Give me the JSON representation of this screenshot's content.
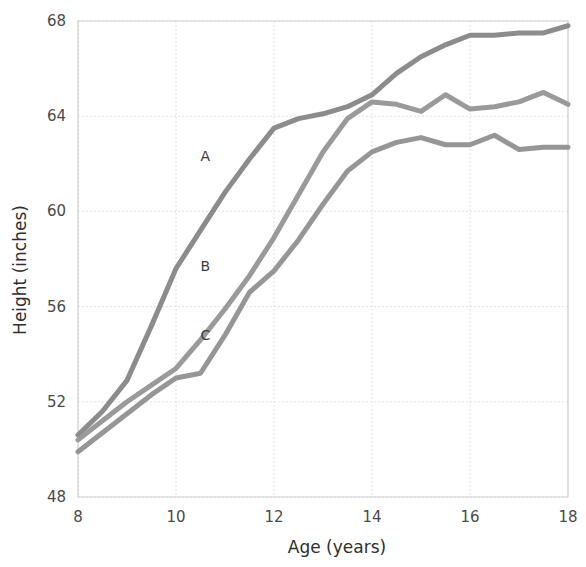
{
  "chart_data": {
    "type": "line",
    "title": "",
    "xlabel": "Age (years)",
    "ylabel": "Height (inches)",
    "xlim": [
      8,
      18
    ],
    "ylim": [
      48,
      68
    ],
    "xticks": [
      8,
      10,
      12,
      14,
      16,
      18
    ],
    "yticks": [
      48,
      52,
      56,
      60,
      64,
      68
    ],
    "xtick_labels": [
      "8",
      "10",
      "12",
      "14",
      "16",
      "18"
    ],
    "ytick_labels": [
      "48",
      "52",
      "56",
      "60",
      "64",
      "68"
    ],
    "grid": true,
    "legend_position": "inline-annotations",
    "x": [
      8,
      8.5,
      9,
      9.5,
      10,
      10.5,
      11,
      11.5,
      12,
      12.5,
      13,
      13.5,
      14,
      14.5,
      15,
      15.5,
      16,
      16.5,
      17,
      17.5,
      18
    ],
    "series": [
      {
        "name": "A",
        "label": "A",
        "color": "#8c8c8c",
        "values": [
          50.6,
          51.6,
          52.9,
          55.2,
          57.6,
          59.2,
          60.8,
          62.2,
          63.5,
          63.9,
          64.1,
          64.4,
          64.9,
          65.8,
          66.5,
          67.0,
          67.4,
          67.4,
          67.5,
          67.5,
          67.8
        ],
        "annotation": {
          "text": "A",
          "x": 10.6,
          "y": 62.1
        }
      },
      {
        "name": "B",
        "label": "B",
        "color": "#9a9a9a",
        "values": [
          50.4,
          51.2,
          52.0,
          52.7,
          53.4,
          54.6,
          55.9,
          57.3,
          58.9,
          60.7,
          62.5,
          63.9,
          64.6,
          64.5,
          64.2,
          64.9,
          64.3,
          64.4,
          64.6,
          65.0,
          64.5
        ],
        "annotation": {
          "text": "B",
          "x": 10.6,
          "y": 57.5
        }
      },
      {
        "name": "C",
        "label": "C",
        "color": "#969696",
        "values": [
          49.9,
          50.7,
          51.5,
          52.3,
          53.0,
          53.2,
          54.8,
          56.6,
          57.5,
          58.8,
          60.3,
          61.7,
          62.5,
          62.9,
          63.1,
          62.8,
          62.8,
          63.2,
          62.6,
          62.7,
          62.7
        ],
        "annotation": {
          "text": "C",
          "x": 10.6,
          "y": 54.6
        }
      }
    ]
  },
  "axis": {
    "x_title": "Age (years)",
    "y_title": "Height (inches)"
  },
  "colors": {
    "grid": "#e2e2e2",
    "axis": "#d0d0d0",
    "text": "#3a3a3a",
    "series_a": "#8c8c8c",
    "series_b": "#9a9a9a",
    "series_c": "#969696",
    "background": "#ffffff"
  }
}
